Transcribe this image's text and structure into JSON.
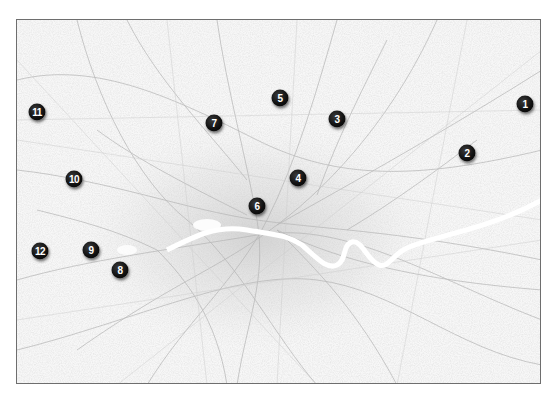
{
  "map": {
    "region": "Greater London street map (greyscale)",
    "frame_color": "#6e6e6e",
    "background_color": "#f7f7f7",
    "road_color": "#bdbdbd",
    "river_color": "#ffffff",
    "marker_color": "#111111",
    "marker_text_color": "#ffffff",
    "markers": [
      {
        "label": "1",
        "x": 525,
        "y": 104
      },
      {
        "label": "2",
        "x": 467,
        "y": 153
      },
      {
        "label": "3",
        "x": 337,
        "y": 119
      },
      {
        "label": "4",
        "x": 298,
        "y": 178
      },
      {
        "label": "5",
        "x": 280,
        "y": 98
      },
      {
        "label": "6",
        "x": 257,
        "y": 206
      },
      {
        "label": "7",
        "x": 214,
        "y": 123
      },
      {
        "label": "8",
        "x": 120,
        "y": 270
      },
      {
        "label": "9",
        "x": 91,
        "y": 250
      },
      {
        "label": "10",
        "x": 74,
        "y": 179
      },
      {
        "label": "11",
        "x": 37,
        "y": 112
      },
      {
        "label": "12",
        "x": 40,
        "y": 251
      }
    ]
  }
}
